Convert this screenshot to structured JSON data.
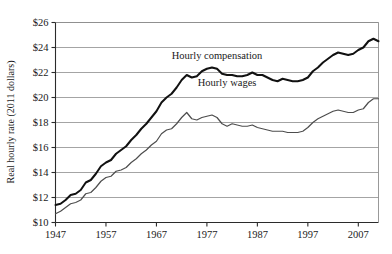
{
  "chart_data": {
    "type": "line",
    "title": "",
    "xlabel": "",
    "ylabel": "Real hourly rate (2011 dollars)",
    "xlim": [
      1947,
      2011
    ],
    "ylim": [
      10,
      26
    ],
    "grid": true,
    "grid_axis": "y",
    "legend_position": "inline-annotations",
    "xticks": [
      1947,
      1957,
      1967,
      1977,
      1987,
      1997,
      2007
    ],
    "xtick_labels": [
      "1947",
      "1957",
      "1967",
      "1977",
      "1987",
      "1997",
      "2007"
    ],
    "yticks": [
      10,
      12,
      14,
      16,
      18,
      20,
      22,
      24,
      26
    ],
    "ytick_labels": [
      "$10",
      "$12",
      "$14",
      "$16",
      "$18",
      "$20",
      "$22",
      "$24",
      "$26"
    ],
    "annotations": [
      {
        "text": "Hourly compensation",
        "x": 1979,
        "y": 23.1
      },
      {
        "text": "Hourly wages",
        "x": 1981,
        "y": 20.9
      }
    ],
    "series": [
      {
        "name": "Hourly compensation",
        "color": "#111111",
        "width": 2.0,
        "x": [
          1947,
          1948,
          1949,
          1950,
          1951,
          1952,
          1953,
          1954,
          1955,
          1956,
          1957,
          1958,
          1959,
          1960,
          1961,
          1962,
          1963,
          1964,
          1965,
          1966,
          1967,
          1968,
          1969,
          1970,
          1971,
          1972,
          1973,
          1974,
          1975,
          1976,
          1977,
          1978,
          1979,
          1980,
          1981,
          1982,
          1983,
          1984,
          1985,
          1986,
          1987,
          1988,
          1989,
          1990,
          1991,
          1992,
          1993,
          1994,
          1995,
          1996,
          1997,
          1998,
          1999,
          2000,
          2001,
          2002,
          2003,
          2004,
          2005,
          2006,
          2007,
          2008,
          2009,
          2010,
          2011
        ],
        "y": [
          11.4,
          11.5,
          11.8,
          12.2,
          12.3,
          12.6,
          13.2,
          13.4,
          13.9,
          14.5,
          14.8,
          15.0,
          15.5,
          15.8,
          16.1,
          16.6,
          17.0,
          17.5,
          17.9,
          18.4,
          18.9,
          19.6,
          20.0,
          20.3,
          20.8,
          21.4,
          21.8,
          21.6,
          21.7,
          22.1,
          22.3,
          22.4,
          22.3,
          21.9,
          21.8,
          21.8,
          21.7,
          21.7,
          21.8,
          22.0,
          21.8,
          21.8,
          21.6,
          21.4,
          21.3,
          21.5,
          21.4,
          21.3,
          21.3,
          21.4,
          21.6,
          22.1,
          22.4,
          22.8,
          23.1,
          23.4,
          23.6,
          23.5,
          23.4,
          23.5,
          23.8,
          24.0,
          24.5,
          24.7,
          24.5
        ]
      },
      {
        "name": "Hourly wages",
        "color": "#4d4d4d",
        "width": 1.2,
        "x": [
          1947,
          1948,
          1949,
          1950,
          1951,
          1952,
          1953,
          1954,
          1955,
          1956,
          1957,
          1958,
          1959,
          1960,
          1961,
          1962,
          1963,
          1964,
          1965,
          1966,
          1967,
          1968,
          1969,
          1970,
          1971,
          1972,
          1973,
          1974,
          1975,
          1976,
          1977,
          1978,
          1979,
          1980,
          1981,
          1982,
          1983,
          1984,
          1985,
          1986,
          1987,
          1988,
          1989,
          1990,
          1991,
          1992,
          1993,
          1994,
          1995,
          1996,
          1997,
          1998,
          1999,
          2000,
          2001,
          2002,
          2003,
          2004,
          2005,
          2006,
          2007,
          2008,
          2009,
          2010,
          2011
        ],
        "y": [
          10.7,
          10.9,
          11.2,
          11.5,
          11.6,
          11.8,
          12.3,
          12.4,
          12.8,
          13.3,
          13.6,
          13.7,
          14.1,
          14.2,
          14.4,
          14.8,
          15.1,
          15.5,
          15.8,
          16.2,
          16.5,
          17.1,
          17.4,
          17.5,
          17.9,
          18.4,
          18.8,
          18.3,
          18.2,
          18.4,
          18.5,
          18.6,
          18.4,
          17.9,
          17.7,
          17.9,
          17.8,
          17.7,
          17.7,
          17.8,
          17.6,
          17.5,
          17.4,
          17.3,
          17.3,
          17.3,
          17.2,
          17.2,
          17.2,
          17.3,
          17.6,
          18.0,
          18.3,
          18.5,
          18.7,
          18.9,
          19.0,
          18.9,
          18.8,
          18.8,
          19.0,
          19.1,
          19.6,
          19.9,
          19.9
        ]
      }
    ]
  }
}
